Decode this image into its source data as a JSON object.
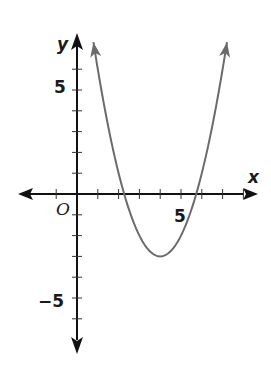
{
  "chart_data": {
    "type": "line",
    "title": "",
    "xlabel": "x",
    "ylabel": "y",
    "origin_label": "O",
    "xlim": [
      -2.5,
      8.5
    ],
    "ylim": [
      -7.5,
      7.5
    ],
    "x_tick_labels": [
      {
        "value": 5,
        "label": "5"
      }
    ],
    "y_tick_labels": [
      {
        "value": 5,
        "label": "5"
      },
      {
        "value": -5,
        "label": "−5"
      }
    ],
    "x_ticks": [
      -1,
      1,
      2,
      3,
      4,
      5,
      6,
      7,
      8
    ],
    "y_ticks": [
      -6,
      -5,
      -4,
      -3,
      -2,
      -1,
      1,
      2,
      3,
      4,
      5,
      6
    ],
    "grid": false,
    "legend": null,
    "series": [
      {
        "name": "parabola",
        "description": "Upward-opening parabola with vertex at (4, -3), x-intercepts near 2.3 and 5.7, arrows on both ends",
        "vertex": [
          4,
          -3
        ],
        "equation_estimate": "y = (x - 4)^2 - 3",
        "x": [
          1,
          1.5,
          2,
          2.27,
          3,
          3.5,
          4,
          4.5,
          5,
          5.73,
          6,
          6.5,
          7
        ],
        "y": [
          6,
          3.25,
          1,
          0,
          -2,
          -2.75,
          -3,
          -2.75,
          -2,
          0,
          1,
          3.25,
          6
        ],
        "color": "#6b6b6b"
      }
    ],
    "axis_color": "#111111"
  }
}
